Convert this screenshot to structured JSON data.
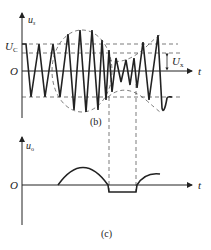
{
  "figure_b": {
    "y_axis_label": "u",
    "y_axis_sub": "s",
    "x_axis_label": "t",
    "origin_label": "O",
    "level_label": "U",
    "level_sub": "C",
    "amplitude_label": "U",
    "amplitude_sub": "x",
    "caption": "(b)"
  },
  "figure_c": {
    "y_axis_label": "u",
    "y_axis_sub": "o",
    "x_axis_label": "t",
    "origin_label": "O",
    "caption": "(c)"
  },
  "colors": {
    "stroke": "#222222",
    "dashed": "#444444"
  }
}
